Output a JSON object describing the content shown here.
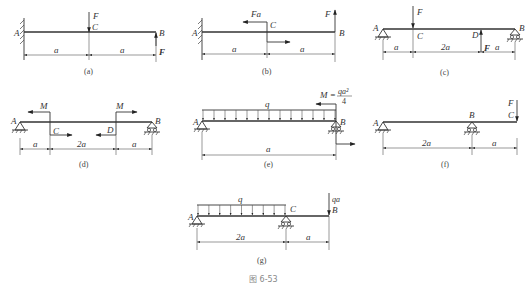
{
  "figure_caption": "图 6-53",
  "panels": {
    "a": {
      "caption": "(a)",
      "points": {
        "A": "A",
        "B": "B",
        "C": "C"
      },
      "loads": {
        "F_top": "F",
        "F_end": "F"
      },
      "dims": [
        "a",
        "a"
      ]
    },
    "b": {
      "caption": "(b)",
      "points": {
        "A": "A",
        "B": "B",
        "C": "C"
      },
      "loads": {
        "moment": "Fa",
        "F_end": "F"
      },
      "dims": [
        "a",
        "a"
      ]
    },
    "c": {
      "caption": "(c)",
      "points": {
        "A": "A",
        "B": "B",
        "C": "C",
        "D": "D"
      },
      "loads": {
        "F_top": "F",
        "F_up": "F"
      },
      "dims": [
        "a",
        "2a",
        "a"
      ]
    },
    "d": {
      "caption": "(d)",
      "points": {
        "A": "A",
        "B": "B",
        "C": "C",
        "D": "D"
      },
      "loads": {
        "M1": "M",
        "M2": "M"
      },
      "dims": [
        "a",
        "2a",
        "a"
      ]
    },
    "e": {
      "caption": "(e)",
      "points": {
        "A": "A",
        "B": "B"
      },
      "loads": {
        "q": "q",
        "M_prefix": "M =",
        "M_num": "qa²",
        "M_den": "4"
      },
      "dims": [
        "a"
      ]
    },
    "f": {
      "caption": "(f)",
      "points": {
        "A": "A",
        "B": "B",
        "C": "C"
      },
      "loads": {
        "F_end": "F"
      },
      "dims": [
        "2a",
        "a"
      ]
    },
    "g": {
      "caption": "(g)",
      "points": {
        "A": "A",
        "B": "B",
        "C": "C"
      },
      "loads": {
        "q": "q",
        "P": "qa"
      },
      "dims": [
        "2a",
        "a"
      ]
    }
  }
}
